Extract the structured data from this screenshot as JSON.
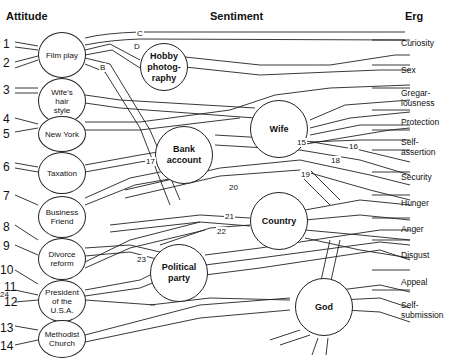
{
  "headers": {
    "attitude": "Attitude",
    "sentiment": "Sentiment",
    "erg": "Erg"
  },
  "attitudes": [
    {
      "label": "Film play"
    },
    {
      "label": "Wife's hair style"
    },
    {
      "label": "New York"
    },
    {
      "label": "Taxation"
    },
    {
      "label": "Business Friend"
    },
    {
      "label": "Divorce reform"
    },
    {
      "label": "President of the U.S.A."
    },
    {
      "label": "Methodist Church"
    }
  ],
  "sentiments": [
    {
      "label": "Hobby photog-raphy"
    },
    {
      "label": "Wife"
    },
    {
      "label": "Bank account"
    },
    {
      "label": "Country"
    },
    {
      "label": "Political party"
    },
    {
      "label": "God"
    }
  ],
  "ergs": [
    "Curiosity",
    "Sex",
    "Gregar-iousness",
    "Protection",
    "Self-assertion",
    "Security",
    "Hunger",
    "Anger",
    "Disgust",
    "Appeal",
    "Self-submission"
  ],
  "numbers": [
    "1",
    "2",
    "3",
    "4",
    "5",
    "6",
    "7",
    "8",
    "9",
    "10",
    "11",
    "12",
    "13",
    "14",
    "24"
  ],
  "path_labels": [
    "A",
    "B",
    "C",
    "D",
    "15",
    "16",
    "17",
    "18",
    "19",
    "20",
    "21",
    "22",
    "23"
  ]
}
